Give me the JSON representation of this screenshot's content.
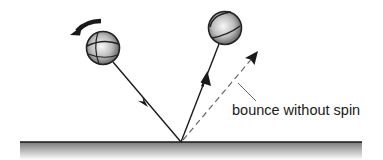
{
  "diagram": {
    "annotations": {
      "dashed_path_label": "bounce without spin"
    },
    "elements": {
      "incoming_ball": {
        "description": "spinning ball approaching the surface",
        "spin_direction": "counterclockwise"
      },
      "outgoing_ball": {
        "description": "ball after bouncing with spin, steeper rebound"
      },
      "surface": {
        "description": "flat ground surface"
      }
    },
    "colors": {
      "line": "#1a1a1a",
      "dashed_line": "#666666",
      "ball_light": "#f4f4f4",
      "ball_dark": "#5a5a5a",
      "ground_top": "#8a8a8a"
    }
  }
}
